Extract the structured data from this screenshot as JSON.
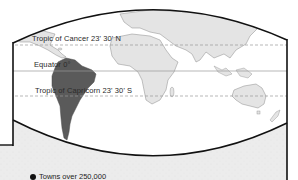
{
  "map": {
    "type": "equatorial-zone world map",
    "highlighted_region": "South America",
    "colors": {
      "highlight": "#5a5a5a",
      "land": "#e4e4e4",
      "ocean": "#ffffff",
      "outside_frame": "#ececec",
      "frame": "#111111",
      "latitude_line": "#9a9a9a"
    },
    "latitude_lines": [
      {
        "label": "Tropic of Cancer 23' 30' N",
        "style": "dashed"
      },
      {
        "label": "Equator 0°",
        "style": "solid"
      },
      {
        "label": "Tropic of Capricorn 23' 30' S",
        "style": "dashed"
      }
    ]
  },
  "legend": {
    "items": [
      {
        "symbol": "filled-circle",
        "label": "Towns over 250,000"
      }
    ]
  }
}
